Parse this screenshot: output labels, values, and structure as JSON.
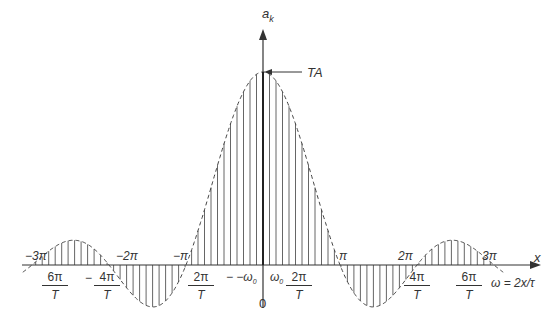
{
  "diagram": {
    "y_axis_label": "a",
    "y_axis_label_sub": "k",
    "x_axis_label": "x",
    "peak_label": "TA",
    "omega_relation": "ω = 2x/τ",
    "origin_label": "0",
    "omega0_pos": "ω",
    "omega0_neg": "− −ω",
    "omega_sub": "0",
    "x_pi_labels": [
      {
        "text": "−3π"
      },
      {
        "text": "−2π"
      },
      {
        "text": "−π"
      },
      {
        "text": "π"
      },
      {
        "text": "2π"
      },
      {
        "text": "3π"
      }
    ],
    "omega_fractions": [
      {
        "prefix": "",
        "num": "6π",
        "den": "T"
      },
      {
        "prefix": "−",
        "num": "4π",
        "den": "T"
      },
      {
        "num": "2π",
        "den": "T"
      },
      {
        "num": "2π",
        "den": "T"
      },
      {
        "num": "4π",
        "den": "T"
      },
      {
        "num": "6π",
        "den": "T"
      }
    ],
    "colors": {
      "line": "#333333",
      "stem": "#555555",
      "envelope": "#444444",
      "background": "#ffffff"
    }
  },
  "chart_data": {
    "type": "stem",
    "title": "",
    "xlabel": "x  (ω = 2x/τ)",
    "ylabel": "a_k",
    "envelope": "TA · sin(x)/x (dashed)",
    "peak_value_label": "TA",
    "x_ticks": [
      "−3π",
      "−2π",
      "−π",
      "0",
      "π",
      "2π",
      "3π"
    ],
    "omega_ticks": [
      "−6π/T",
      "−4π/T",
      "−2π/T",
      "−ω0",
      "ω0",
      "2π/T",
      "4π/T",
      "6π/T"
    ],
    "zero_crossings_x": [
      -3.14159,
      -6.28318,
      -9.42477,
      3.14159,
      6.28318,
      9.42477
    ],
    "x_range": [
      -9.8,
      9.8
    ],
    "stem_spacing_x": 0.265,
    "grid": false
  }
}
